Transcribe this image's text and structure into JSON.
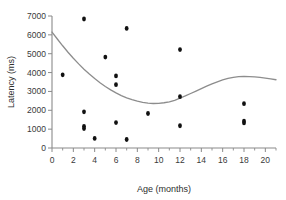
{
  "chart_data": {
    "type": "scatter",
    "title": "",
    "xlabel": "Age (months)",
    "ylabel": "Latency (ms)",
    "xlim": [
      0,
      21
    ],
    "ylim": [
      0,
      7000
    ],
    "grid": false,
    "legend": false,
    "xticks": [
      0,
      2,
      4,
      6,
      8,
      10,
      12,
      14,
      16,
      18,
      20
    ],
    "xtick_labels": [
      "0",
      "2",
      "4",
      "6",
      "8",
      "10",
      "12",
      "14",
      "16",
      "18",
      "20"
    ],
    "xminor_ticks": [
      1,
      3,
      5,
      7,
      9,
      11,
      13,
      15,
      17,
      19,
      21
    ],
    "yticks": [
      0,
      1000,
      2000,
      3000,
      4000,
      5000,
      6000,
      7000
    ],
    "ytick_labels": [
      "0",
      "1000",
      "2000",
      "3000",
      "4000",
      "5000",
      "6000",
      "7000"
    ],
    "marker": "filled-dot",
    "marker_color": "#111111",
    "points": [
      {
        "x": 1,
        "y": 3880
      },
      {
        "x": 3,
        "y": 6840
      },
      {
        "x": 3,
        "y": 1920
      },
      {
        "x": 3,
        "y": 1150
      },
      {
        "x": 3,
        "y": 1030
      },
      {
        "x": 4,
        "y": 510
      },
      {
        "x": 5,
        "y": 4820
      },
      {
        "x": 6,
        "y": 3820
      },
      {
        "x": 6,
        "y": 3360
      },
      {
        "x": 6,
        "y": 1350
      },
      {
        "x": 7,
        "y": 6340
      },
      {
        "x": 7,
        "y": 450
      },
      {
        "x": 9,
        "y": 1830
      },
      {
        "x": 12,
        "y": 5220
      },
      {
        "x": 12,
        "y": 2720
      },
      {
        "x": 12,
        "y": 1180
      },
      {
        "x": 18,
        "y": 2350
      },
      {
        "x": 18,
        "y": 1430
      },
      {
        "x": 18,
        "y": 1330
      }
    ],
    "trend": {
      "name": "fitted curve",
      "color": "#8d8d8d",
      "x": [
        0.0,
        0.5,
        1.0,
        1.5,
        2.0,
        2.5,
        3.0,
        3.5,
        4.0,
        4.5,
        5.0,
        5.5,
        6.0,
        6.5,
        7.0,
        7.5,
        8.0,
        8.5,
        9.0,
        9.5,
        10.0,
        10.5,
        11.0,
        11.5,
        12.0,
        12.5,
        13.0,
        13.5,
        14.0,
        14.5,
        15.0,
        15.5,
        16.0,
        16.5,
        17.0,
        17.5,
        18.0,
        18.5,
        19.0,
        19.5,
        20.0,
        20.5,
        21.0
      ],
      "y": [
        6150,
        5780,
        5420,
        5080,
        4760,
        4460,
        4180,
        3920,
        3680,
        3460,
        3260,
        3080,
        2920,
        2780,
        2660,
        2560,
        2480,
        2420,
        2380,
        2360,
        2370,
        2400,
        2450,
        2530,
        2640,
        2760,
        2890,
        3020,
        3150,
        3280,
        3400,
        3510,
        3610,
        3690,
        3750,
        3790,
        3800,
        3790,
        3770,
        3740,
        3710,
        3670,
        3620
      ]
    }
  }
}
